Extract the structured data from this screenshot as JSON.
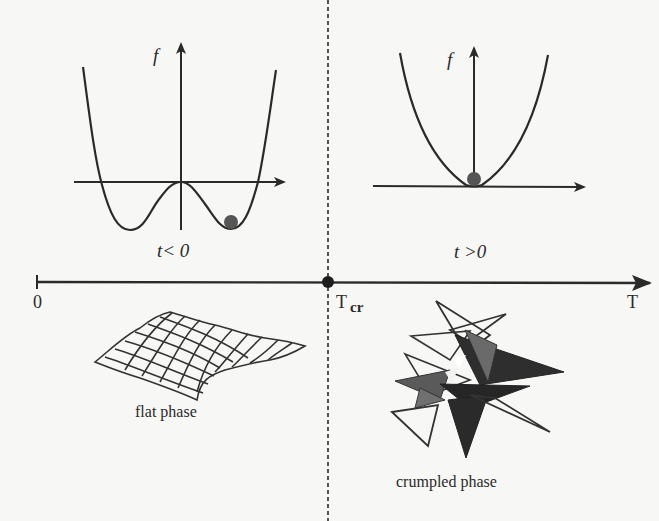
{
  "diagram": {
    "type": "phase-diagram",
    "left_panel": {
      "y_axis_label": "f",
      "condition_label": "t< 0",
      "curve": "double-well potential",
      "ball_position": "right minimum"
    },
    "right_panel": {
      "y_axis_label": "f",
      "condition_label": "t >0",
      "curve": "single-well parabola",
      "ball_position": "center minimum"
    },
    "temperature_axis": {
      "origin_label": "0",
      "critical_label": "T",
      "critical_subscript": "cr",
      "end_label": "T"
    },
    "phases": {
      "left": "flat phase",
      "right": "crumpled phase"
    },
    "colors": {
      "line": "#2a2a2a",
      "ball": "#555555",
      "background": "#f7f7f5"
    }
  }
}
